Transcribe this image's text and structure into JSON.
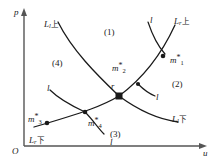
{
  "figure": {
    "type": "phase-plane-diagram",
    "axes": {
      "y_label": "p",
      "x_label": "u",
      "origin_label": "O"
    },
    "regions": [
      {
        "id": "1",
        "label": "(1)",
        "x": 104,
        "y": 28
      },
      {
        "id": "2",
        "label": "(2)",
        "x": 172,
        "y": 80
      },
      {
        "id": "3",
        "label": "(3)",
        "x": 110,
        "y": 130
      },
      {
        "id": "4",
        "label": "(4)",
        "x": 52,
        "y": 59
      }
    ],
    "curve_labels": [
      {
        "name": "L_l_upper",
        "base": "L",
        "sub": "l",
        "cjk": "上",
        "x": 44,
        "y": 20
      },
      {
        "name": "L_r_upper",
        "base": "L",
        "sub": "r",
        "cjk": "上",
        "x": 174,
        "y": 17
      },
      {
        "name": "L_l_lower",
        "base": "L",
        "sub": "l",
        "cjk": "下",
        "x": 172,
        "y": 115
      },
      {
        "name": "L_r_lower",
        "base": "L",
        "sub": "r",
        "cjk": "下",
        "x": 29,
        "y": 136
      }
    ],
    "elementary_wave_labels": [
      {
        "name": "l-top-right",
        "label": "l",
        "x": 150,
        "y": 16
      },
      {
        "name": "l-left",
        "label": "l",
        "x": 47,
        "y": 84
      },
      {
        "name": "l-right",
        "label": "l",
        "x": 156,
        "y": 93
      },
      {
        "name": "l-bottom",
        "label": "l",
        "x": 110,
        "y": 138
      }
    ],
    "states": [
      {
        "name": "m1",
        "base": "m",
        "star": "*",
        "sub": "1",
        "x": 170,
        "y": 54,
        "dot_x": 163,
        "dot_y": 56
      },
      {
        "name": "m2",
        "base": "m",
        "star": "*",
        "sub": "2",
        "x": 112,
        "y": 62,
        "dot_x": 138,
        "dot_y": 84
      },
      {
        "name": "m3",
        "base": "m",
        "star": "*",
        "sub": "3",
        "x": 28,
        "y": 113,
        "dot_x": 47,
        "dot_y": 123
      },
      {
        "name": "m4",
        "base": "m",
        "star": "*",
        "sub": "4",
        "x": 88,
        "y": 117,
        "dot_x": 85,
        "dot_y": 112
      }
    ],
    "intersection": {
      "name": "r",
      "label": "r",
      "x": 111,
      "y": 82,
      "dot_x": 119,
      "dot_y": 96
    },
    "colors": {
      "curve": "#1a1a1a",
      "axis": "#555555",
      "text": "#1a1a1a",
      "background": "#ffffff"
    }
  }
}
